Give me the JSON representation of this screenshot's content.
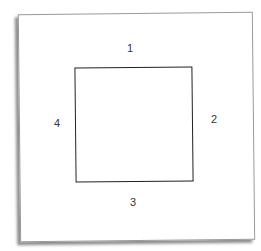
{
  "diagram": {
    "labels": {
      "top": "1",
      "right": "2",
      "bottom": "3",
      "left": "4"
    }
  }
}
